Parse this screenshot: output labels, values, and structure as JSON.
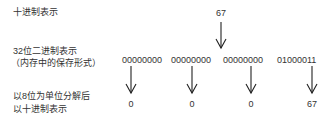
{
  "labels": {
    "decimal": "十进制表示",
    "binary_line1": "32位二进制表示",
    "binary_line2": "（内存中的保存形式）",
    "split_line1": "以8位为单位分解后",
    "split_line2": "以十进制表示"
  },
  "decimal_value": "67",
  "binary_groups": [
    "00000000",
    "00000000",
    "00000000",
    "01000011"
  ],
  "byte_values": [
    "0",
    "0",
    "0",
    "67"
  ],
  "icons": {
    "arrow": "arrow-down-icon"
  },
  "colors": {
    "background": "#ffffff",
    "text": "#333333",
    "arrow": "#222222"
  }
}
